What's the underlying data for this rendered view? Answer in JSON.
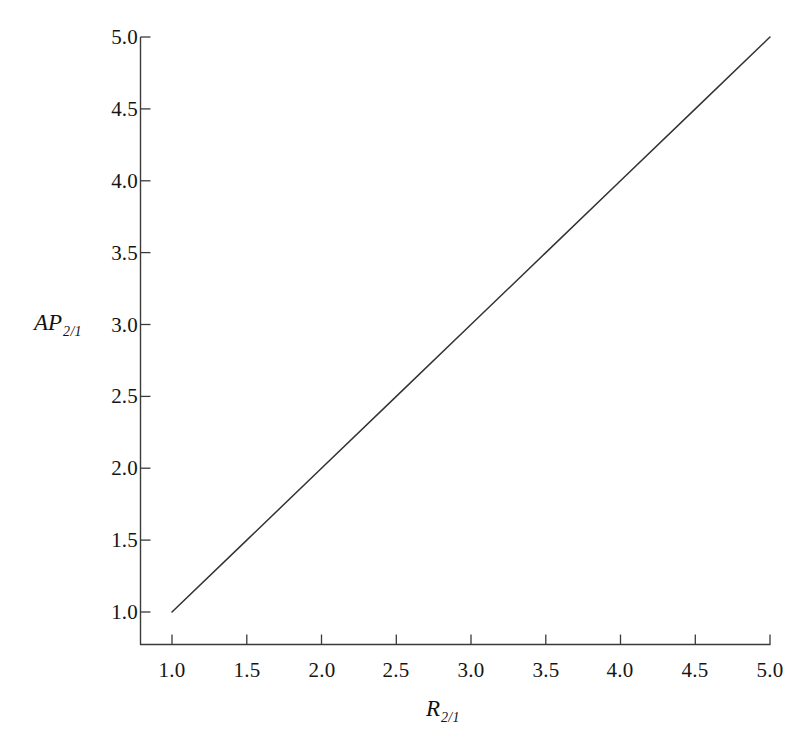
{
  "chart_data": {
    "type": "line",
    "title": "",
    "subtitle": "",
    "xlabel": "R",
    "xlabel_sub": "2/1",
    "ylabel": "AP",
    "ylabel_sub": "2/1",
    "xlim": [
      1.0,
      5.0
    ],
    "ylim": [
      1.0,
      5.0
    ],
    "grid": false,
    "legend": null,
    "legend_position": "none",
    "axis_spines": [
      "left",
      "bottom"
    ],
    "tick_direction": "in",
    "line_color": "#333333",
    "background_color": "#ffffff",
    "xticks": [
      "1.0",
      "1.5",
      "2.0",
      "2.5",
      "3.0",
      "3.5",
      "4.0",
      "4.5",
      "5.0"
    ],
    "xtick_values": [
      1.0,
      1.5,
      2.0,
      2.5,
      3.0,
      3.5,
      4.0,
      4.5,
      5.0
    ],
    "yticks": [
      "1.0",
      "1.5",
      "2.0",
      "2.5",
      "3.0",
      "3.5",
      "4.0",
      "4.5",
      "5.0"
    ],
    "ytick_values": [
      1.0,
      1.5,
      2.0,
      2.5,
      3.0,
      3.5,
      4.0,
      4.5,
      5.0
    ],
    "series": [
      {
        "name": "AP_2/1 vs R_2/1",
        "relation": "y = x",
        "x": [
          1.0,
          1.5,
          2.0,
          2.5,
          3.0,
          3.5,
          4.0,
          4.5,
          5.0
        ],
        "values": [
          1.0,
          1.5,
          2.0,
          2.5,
          3.0,
          3.5,
          4.0,
          4.5,
          5.0
        ]
      }
    ],
    "annotations": []
  }
}
